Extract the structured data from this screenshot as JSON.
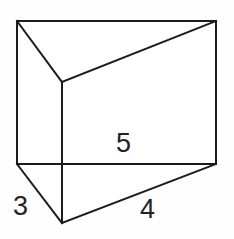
{
  "figure": {
    "name": "triangular-prism",
    "background_color": "#fefefe",
    "stroke_color": "#1c1c1c",
    "stroke_width": 2,
    "label_color": "#232323"
  },
  "labels": {
    "edge_3": "3",
    "edge_4": "4",
    "edge_5": "5"
  },
  "watermark": {
    "line_one": "",
    "line_two": ""
  },
  "geometry": {
    "vertices": {
      "back_top_left": [
        17,
        21
      ],
      "back_top_right": [
        216,
        21
      ],
      "front_top": [
        62,
        82
      ],
      "back_bottom_left": [
        17,
        164
      ],
      "back_bottom_right": [
        216,
        164
      ],
      "front_bottom": [
        62,
        223
      ]
    },
    "edges": [
      {
        "name": "top-back-edge",
        "from": "back_top_left",
        "to": "back_top_right"
      },
      {
        "name": "left-vertical-edge",
        "from": "back_top_left",
        "to": "back_bottom_left"
      },
      {
        "name": "right-vertical-edge",
        "from": "back_top_right",
        "to": "back_bottom_right"
      },
      {
        "name": "bottom-back-edge",
        "from": "back_bottom_left",
        "to": "back_bottom_right"
      },
      {
        "name": "top-left-slant",
        "from": "back_top_left",
        "to": "front_top"
      },
      {
        "name": "top-right-slant",
        "from": "front_top",
        "to": "back_top_right"
      },
      {
        "name": "front-vertical-edge",
        "from": "front_top",
        "to": "front_bottom"
      },
      {
        "name": "bottom-left-slant",
        "from": "back_bottom_left",
        "to": "front_bottom"
      },
      {
        "name": "bottom-right-slant",
        "from": "front_bottom",
        "to": "back_bottom_right"
      }
    ]
  }
}
